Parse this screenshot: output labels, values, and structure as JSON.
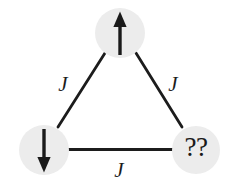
{
  "figure": {
    "background_color": "#ffffff",
    "node_fill_color": "#ececec",
    "edge_color": "#1c1c1c",
    "label_color": "#1c1c1c",
    "nodes": [
      {
        "id": "top",
        "name": "spin-up-node",
        "content_type": "arrow-up",
        "label": "",
        "cx": 120,
        "cy": 33,
        "r": 25
      },
      {
        "id": "bottom-left",
        "name": "spin-down-node",
        "content_type": "arrow-down",
        "label": "",
        "cx": 44,
        "cy": 150,
        "r": 25
      },
      {
        "id": "bottom-right",
        "name": "unknown-spin-node",
        "content_type": "text",
        "label": "??",
        "cx": 196,
        "cy": 150,
        "r": 24
      }
    ],
    "edges": [
      {
        "id": "top-left-edge",
        "name": "coupling-edge-top-left",
        "from": "top",
        "to": "bottom-left",
        "label": "J",
        "label_x": 63,
        "label_y": 86
      },
      {
        "id": "top-right-edge",
        "name": "coupling-edge-top-right",
        "from": "top",
        "to": "bottom-right",
        "label": "J",
        "label_x": 173,
        "label_y": 86
      },
      {
        "id": "bottom-edge",
        "name": "coupling-edge-bottom",
        "from": "bottom-left",
        "to": "bottom-right",
        "label": "J",
        "label_x": 119,
        "label_y": 172
      }
    ]
  }
}
